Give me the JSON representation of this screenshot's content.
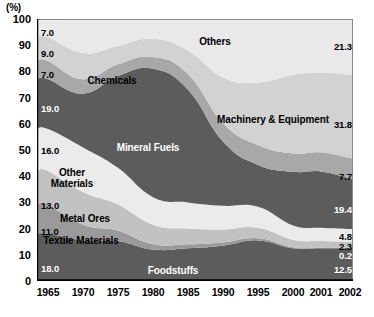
{
  "axis": {
    "unit": "(%)",
    "y_ticks": [
      "100",
      "90",
      "80",
      "70",
      "60",
      "50",
      "40",
      "30",
      "20",
      "10",
      "0"
    ],
    "x_ticks": [
      "1965",
      "1970",
      "1975",
      "1980",
      "1985",
      "1990",
      "1995",
      "2000",
      "2001",
      "2002"
    ]
  },
  "labels": {
    "others": "Others",
    "machinery": "Machinery & Equipment",
    "chemicals": "Chemicals",
    "mineral_fuels": "Mineral Fuels",
    "other_materials_l1": "Other",
    "other_materials_l2": "Materials",
    "metal_ores": "Metal Ores",
    "textile_materials": "Textile Materials",
    "foodstuffs": "Foodstuffs"
  },
  "start_values": {
    "others": "7.0",
    "machinery": "9.0",
    "chemicals": "7.0",
    "mineral_fuels": "19.0",
    "other_materials": "16.0",
    "metal_ores": "13.0",
    "textile_materials": "11.0",
    "foodstuffs": "18.0"
  },
  "end_values": {
    "others": "21.3",
    "machinery": "31.8",
    "chemicals": "7.7",
    "mineral_fuels": "19.4",
    "other_materials": "4.8",
    "metal_ores": "2.3",
    "textile_materials": "0.2",
    "foodstuffs": "12.5"
  },
  "colors": {
    "others": "#e9e9e9",
    "machinery": "#d2d2d2",
    "chemicals": "#a8a8a8",
    "mineral_fuels": "#5c5c5c",
    "other_materials": "#ebebeb",
    "metal_ores": "#c2c2c2",
    "textile_materials": "#9a9a9a",
    "foodstuffs": "#5c5c5c",
    "axis": "#000000",
    "plot_border": "#8a8a8a"
  },
  "chart_data": {
    "type": "area",
    "title": "",
    "subtitle": "",
    "xlabel": "",
    "ylabel": "(%)",
    "ylim": [
      0,
      100
    ],
    "grid": false,
    "legend": "in-plot labels",
    "stacked": true,
    "normalized_to_100": true,
    "x": [
      1965,
      1970,
      1975,
      1980,
      1985,
      1990,
      1995,
      2000,
      2001,
      2002
    ],
    "series": [
      {
        "name": "Foodstuffs",
        "values": [
          18.0,
          15.5,
          15.2,
          12.0,
          12.5,
          13.5,
          15.5,
          12.5,
          12.5,
          12.5
        ]
      },
      {
        "name": "Textile Materials",
        "values": [
          11.0,
          6.0,
          4.0,
          2.0,
          1.5,
          1.2,
          0.8,
          0.4,
          0.3,
          0.2
        ]
      },
      {
        "name": "Metal Ores",
        "values": [
          13.0,
          12.5,
          10.0,
          7.5,
          6.0,
          5.0,
          4.0,
          2.8,
          2.5,
          2.3
        ]
      },
      {
        "name": "Other Materials",
        "values": [
          16.0,
          17.0,
          14.0,
          10.5,
          10.0,
          9.0,
          8.0,
          5.5,
          5.0,
          4.8
        ]
      },
      {
        "name": "Mineral Fuels",
        "values": [
          19.0,
          20.5,
          35.0,
          49.0,
          43.0,
          24.5,
          16.0,
          20.5,
          21.5,
          19.4
        ]
      },
      {
        "name": "Chemicals",
        "values": [
          7.0,
          5.5,
          4.5,
          4.5,
          6.0,
          7.0,
          7.5,
          7.0,
          7.3,
          7.7
        ]
      },
      {
        "name": "Machinery & Equipment",
        "values": [
          9.0,
          10.0,
          7.0,
          7.0,
          9.0,
          17.5,
          24.0,
          30.0,
          30.5,
          31.8
        ]
      },
      {
        "name": "Others",
        "values": [
          7.0,
          13.0,
          10.3,
          7.5,
          12.0,
          22.3,
          24.2,
          21.3,
          20.4,
          21.3
        ]
      }
    ],
    "start_labels": {
      "Others": 7.0,
      "Machinery & Equipment": 9.0,
      "Chemicals": 7.0,
      "Mineral Fuels": 19.0,
      "Other Materials": 16.0,
      "Metal Ores": 13.0,
      "Textile Materials": 11.0,
      "Foodstuffs": 18.0
    },
    "end_labels": {
      "Others": 21.3,
      "Machinery & Equipment": 31.8,
      "Chemicals": 7.7,
      "Mineral Fuels": 19.4,
      "Other Materials": 4.8,
      "Metal Ores": 2.3,
      "Textile Materials": 0.2,
      "Foodstuffs": 12.5
    }
  }
}
